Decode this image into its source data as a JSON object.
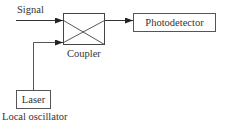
{
  "diagram": {
    "type": "block-diagram",
    "nodes": [
      {
        "id": "signal",
        "label": "Signal",
        "kind": "input-label"
      },
      {
        "id": "coupler",
        "label": "Coupler",
        "kind": "crossed-box"
      },
      {
        "id": "photodetector",
        "label": "Photodetector",
        "kind": "box"
      },
      {
        "id": "laser",
        "label": "Laser",
        "kind": "box"
      },
      {
        "id": "local_oscillator",
        "label": "Local oscillator",
        "kind": "caption"
      }
    ],
    "edges": [
      {
        "from": "signal",
        "to": "coupler",
        "arrow": true
      },
      {
        "from": "laser",
        "to": "coupler",
        "arrow": true
      },
      {
        "from": "coupler",
        "to": "photodetector",
        "arrow": true
      }
    ]
  },
  "labels": {
    "signal": "Signal",
    "coupler": "Coupler",
    "photodetector": "Photodetector",
    "laser": "Laser",
    "local_oscillator": "Local oscillator"
  },
  "colors": {
    "line": "#333333",
    "box_border": "#555555",
    "text": "#333333",
    "background": "#ffffff"
  }
}
